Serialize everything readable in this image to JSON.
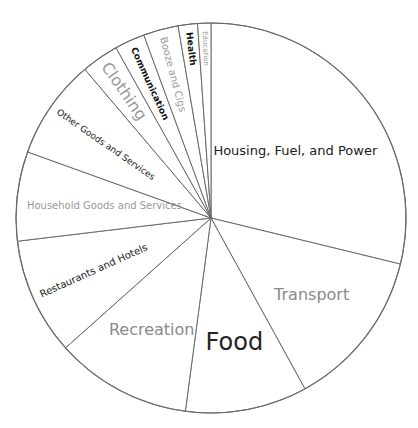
{
  "chart_data": {
    "type": "pie",
    "title": "",
    "start_angle_deg": 0,
    "direction": "clockwise",
    "categories": [
      "Housing, Fuel, and Power",
      "Transport",
      "Food",
      "Recreation",
      "Restaurants and Hotels",
      "Household Goods and Services",
      "Other Goods and Services",
      "Clothing",
      "Communication",
      "Booze and Cigs",
      "Health",
      "Education"
    ],
    "values": [
      28.8,
      13.2,
      10.1,
      11.3,
      9.7,
      7.4,
      8.3,
      3.1,
      2.5,
      2.9,
      1.6,
      1.1
    ],
    "unit": "% share",
    "legend": "none (labels drawn inside slices)",
    "grid": false,
    "label_styles": [
      {
        "size": 13,
        "color": "#222222",
        "orient": "horizontal"
      },
      {
        "size": 16,
        "color": "#8a8a8a",
        "orient": "horizontal"
      },
      {
        "size": 24,
        "color": "#222222",
        "orient": "horizontal"
      },
      {
        "size": 16,
        "color": "#8a8a8a",
        "orient": "horizontal"
      },
      {
        "size": 10,
        "color": "#222222",
        "orient": "radial"
      },
      {
        "size": 10,
        "color": "#999999",
        "orient": "horizontal"
      },
      {
        "size": 9,
        "color": "#222222",
        "orient": "radial"
      },
      {
        "size": 16,
        "color": "#999999",
        "orient": "radial"
      },
      {
        "size": 9,
        "color": "#111111",
        "orient": "radial",
        "bold": true
      },
      {
        "size": 10,
        "color": "#999999",
        "orient": "radial"
      },
      {
        "size": 9,
        "color": "#111111",
        "orient": "radial",
        "bold": true
      },
      {
        "size": 7,
        "color": "#999999",
        "orient": "radial"
      }
    ],
    "colors": {
      "stroke": "#6b6b6b",
      "fill": "#ffffff"
    }
  }
}
